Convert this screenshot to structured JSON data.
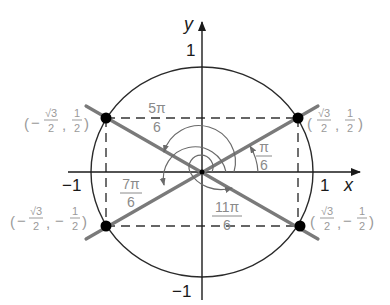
{
  "diagram": {
    "colors": {
      "axis": "#1a1a1a",
      "circle": "#2a2a2a",
      "ray": "#7a7a7a",
      "dot": "#000000",
      "coord_label": "#9a9a9a",
      "angle_label": "#8a8a8a",
      "dashed": "#333333"
    },
    "axes": {
      "x_label": "x",
      "y_label": "y",
      "x_pos_tick": "1",
      "x_neg_tick": "−1",
      "y_pos_tick": "1",
      "y_neg_tick": "−1"
    },
    "points": [
      {
        "quadrant": "I",
        "open": "(",
        "sign_x": "",
        "x_num": "√3",
        "x_den": "2",
        "sep": ",",
        "sign_y": "",
        "y_num": "1",
        "y_den": "2",
        "close": ")"
      },
      {
        "quadrant": "II",
        "open": "(",
        "sign_x": "−",
        "x_num": "√3",
        "x_den": "2",
        "sep": ",",
        "sign_y": "",
        "y_num": "1",
        "y_den": "2",
        "close": ")"
      },
      {
        "quadrant": "III",
        "open": "(",
        "sign_x": "−",
        "x_num": "√3",
        "x_den": "2",
        "sep": ",",
        "sign_y": "−",
        "y_num": "1",
        "y_den": "2",
        "close": ")"
      },
      {
        "quadrant": "IV",
        "open": "(",
        "sign_x": "",
        "x_num": "√3",
        "x_den": "2",
        "sep": ",",
        "sign_y": "−",
        "y_num": "1",
        "y_den": "2",
        "close": ")"
      }
    ],
    "angles": [
      {
        "name": "pi-over-6",
        "num": "π",
        "den": "6"
      },
      {
        "name": "5pi-over-6",
        "num": "5π",
        "den": "6"
      },
      {
        "name": "7pi-over-6",
        "num": "7π",
        "den": "6"
      },
      {
        "name": "11pi-over-6",
        "num": "11π",
        "den": "6"
      }
    ]
  }
}
